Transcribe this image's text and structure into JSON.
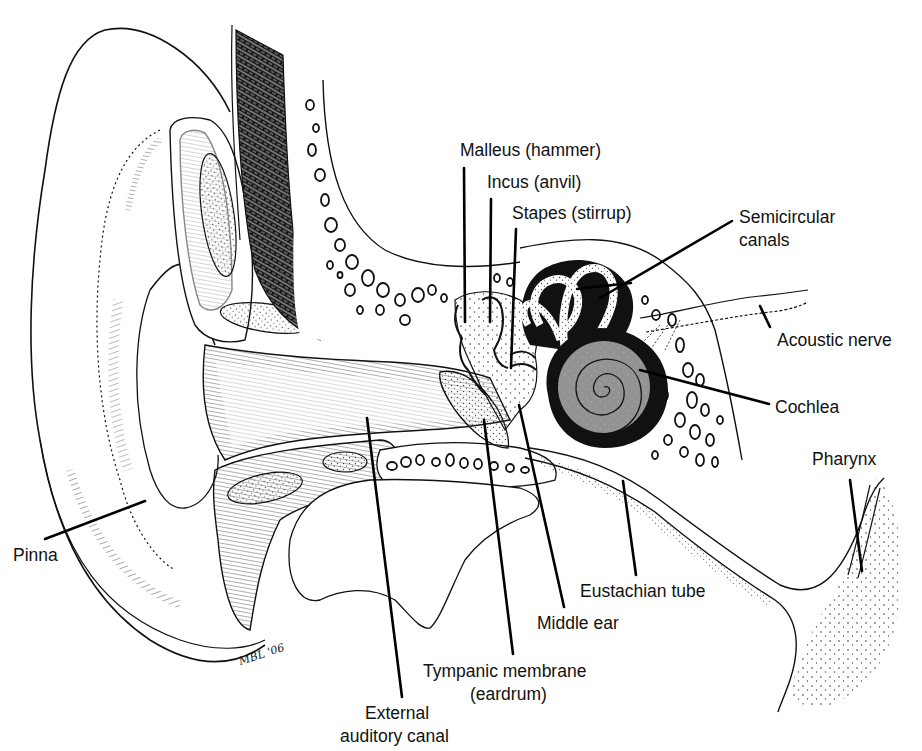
{
  "figure": {
    "signature": "MBL '06"
  },
  "labels": [
    {
      "id": "malleus",
      "text": "Malleus (hammer)",
      "x": 460,
      "y": 140
    },
    {
      "id": "incus",
      "text": "Incus (anvil)",
      "x": 487,
      "y": 172
    },
    {
      "id": "stapes",
      "text": "Stapes (stirrup)",
      "x": 512,
      "y": 203
    },
    {
      "id": "semicircular-1",
      "text": "Semicircular",
      "x": 739,
      "y": 207
    },
    {
      "id": "semicircular-2",
      "text": "canals",
      "x": 739,
      "y": 230
    },
    {
      "id": "acoustic-nerve",
      "text": "Acoustic nerve",
      "x": 777,
      "y": 330
    },
    {
      "id": "cochlea",
      "text": "Cochlea",
      "x": 775,
      "y": 397
    },
    {
      "id": "pharynx",
      "text": "Pharynx",
      "x": 812,
      "y": 449
    },
    {
      "id": "pinna",
      "text": "Pinna",
      "x": 13,
      "y": 545
    },
    {
      "id": "eustachian-tube",
      "text": "Eustachian tube",
      "x": 580,
      "y": 581
    },
    {
      "id": "middle-ear",
      "text": "Middle ear",
      "x": 537,
      "y": 613
    },
    {
      "id": "tympanic-1",
      "text": "Tympanic membrane",
      "x": 423,
      "y": 661
    },
    {
      "id": "tympanic-2",
      "text": "(eardrum)",
      "x": 470,
      "y": 684
    },
    {
      "id": "external-1",
      "text": "External",
      "x": 365,
      "y": 703
    },
    {
      "id": "external-2",
      "text": "auditory canal",
      "x": 340,
      "y": 726
    }
  ],
  "leaders": [
    {
      "id": "malleus-leader",
      "x1": 464,
      "y1": 168,
      "x2": 465,
      "y2": 322
    },
    {
      "id": "incus-leader",
      "x1": 491,
      "y1": 199,
      "x2": 490,
      "y2": 322
    },
    {
      "id": "stapes-leader",
      "x1": 516,
      "y1": 229,
      "x2": 511,
      "y2": 368
    },
    {
      "id": "semicircular-leader-a",
      "x1": 732,
      "y1": 221,
      "x2": 600,
      "y2": 298
    },
    {
      "id": "semicircular-leader-b",
      "x1": 631,
      "y1": 283,
      "x2": 577,
      "y2": 289
    },
    {
      "id": "acoustic-leader",
      "x1": 760,
      "y1": 306,
      "x2": 770,
      "y2": 327
    },
    {
      "id": "cochlea-leader",
      "x1": 640,
      "y1": 370,
      "x2": 769,
      "y2": 404
    },
    {
      "id": "pharynx-leader",
      "x1": 850,
      "y1": 480,
      "x2": 862,
      "y2": 571
    },
    {
      "id": "pinna-leader",
      "x1": 45,
      "y1": 539,
      "x2": 145,
      "y2": 501
    },
    {
      "id": "eustachian-leader",
      "x1": 623,
      "y1": 481,
      "x2": 636,
      "y2": 575
    },
    {
      "id": "middle-ear-leader",
      "x1": 519,
      "y1": 405,
      "x2": 564,
      "y2": 607
    },
    {
      "id": "tympanic-leader",
      "x1": 484,
      "y1": 420,
      "x2": 513,
      "y2": 654
    },
    {
      "id": "external-leader",
      "x1": 367,
      "y1": 418,
      "x2": 402,
      "y2": 697
    }
  ],
  "colors": {
    "ink": "#111111",
    "paper": "#ffffff",
    "bone_fill": "#1a1a1a",
    "stipple": "#444444"
  }
}
